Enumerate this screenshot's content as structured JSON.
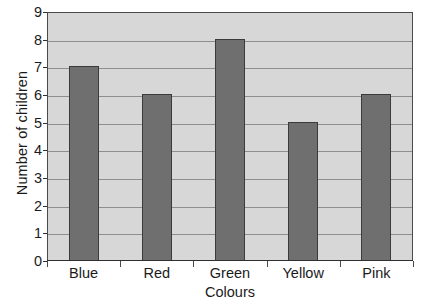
{
  "chart_data": {
    "type": "bar",
    "title": "",
    "subtitle": "",
    "categories": [
      "Blue",
      "Red",
      "Green",
      "Yellow",
      "Pink"
    ],
    "values": [
      7,
      6,
      8,
      5,
      6
    ],
    "xlabel": "Colours",
    "ylabel": "Number of children",
    "ylim": [
      0,
      9
    ],
    "y_ticks": [
      0,
      1,
      2,
      3,
      4,
      5,
      6,
      7,
      8,
      9
    ],
    "y_tick_labels": [
      "0",
      "1",
      "2",
      "3",
      "4",
      "5",
      "6",
      "7",
      "8",
      "9"
    ],
    "grid": true,
    "grid_axis": "y",
    "legend": false,
    "legend_position": "none",
    "annotations": []
  },
  "style": {
    "page_background": "#ffffff",
    "plot_background": "#d7d7d7",
    "plot_border": "#4a4a4a",
    "gridline_color": "#8e8e8e",
    "bar_fill": "#6f6f6f",
    "bar_border": "#3b3b3b",
    "axis_line": "#2f2f2f",
    "text_color": "#1a1a1a"
  }
}
